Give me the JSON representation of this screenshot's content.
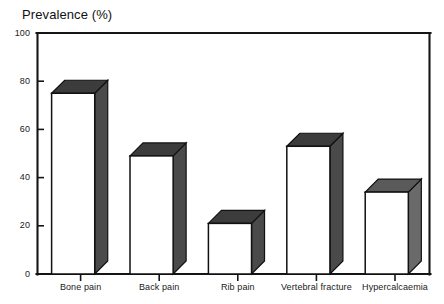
{
  "chart_data": {
    "type": "bar",
    "title": "Prevalence (%)",
    "xlabel": "",
    "ylabel": "Prevalence (%)",
    "categories": [
      "Bone pain",
      "Back pain",
      "Rib pain",
      "Vertebral fracture",
      "Hypercalcaemia"
    ],
    "values": [
      75,
      49,
      21,
      53,
      34
    ],
    "ylim": [
      0,
      100
    ],
    "yticks": [
      0,
      20,
      40,
      60,
      80,
      100
    ],
    "ytick_labels": [
      "0",
      "20",
      "40",
      "60",
      "80",
      "100"
    ],
    "grid": false,
    "legend": null,
    "style": "3d-bar",
    "colors": {
      "bar_front": "#ffffff",
      "bar_top": "#3a3a3a",
      "bar_side": "#4a4a4a",
      "axis": "#151515",
      "text": "#1a1a1a"
    }
  },
  "axis_title": "Prevalence (%)"
}
